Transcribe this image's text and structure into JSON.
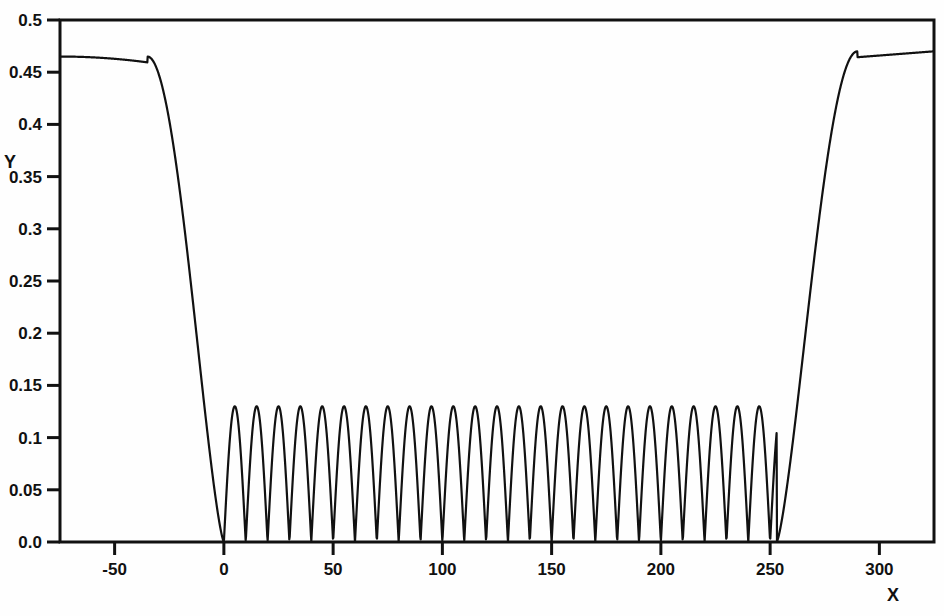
{
  "chart_data": {
    "type": "line",
    "title": "",
    "subtitle": "",
    "xlabel": "X",
    "ylabel": "Y",
    "xlim": [
      -75,
      325
    ],
    "ylim": [
      0.0,
      0.5
    ],
    "grid": false,
    "legend": null,
    "x_ticks": [
      -50,
      0,
      50,
      100,
      150,
      200,
      250,
      300
    ],
    "x_tick_labels": [
      "-50",
      "0",
      "50",
      "100",
      "150",
      "200",
      "250",
      "300"
    ],
    "y_ticks": [
      0.0,
      0.05,
      0.1,
      0.15,
      0.2,
      0.25,
      0.3,
      0.35,
      0.4,
      0.45,
      0.5
    ],
    "y_tick_labels": [
      "0.0",
      "0.05",
      "0.1",
      "0.15",
      "0.2",
      "0.25",
      "0.3",
      "0.35",
      "0.4",
      "0.45",
      "0.5"
    ],
    "series": [
      {
        "name": "curve",
        "color": "#111111",
        "line_width": 2.2,
        "description": "Flat plateau near 0.465 at left, steep drop to zero at x=0, rectified-sine oscillations of amplitude 0.130 and period 10 between x=0 and x=253, then steep rise back to 0.470 at right edge",
        "plateau_left_value": 0.465,
        "plateau_right_value": 0.47,
        "oscillation_start_x": 0,
        "oscillation_end_x": 253,
        "oscillation_amplitude": 0.13,
        "oscillation_period": 10,
        "oscillation_count": 25,
        "envelope_left_knee_x": -35,
        "envelope_right_knee_x": 290,
        "min_value": 0.0,
        "max_value": 0.47
      }
    ]
  },
  "axes": {
    "x_axis_label": "X",
    "y_axis_label": "Y"
  },
  "colors": {
    "background": "#fefefe",
    "ink": "#111111"
  }
}
